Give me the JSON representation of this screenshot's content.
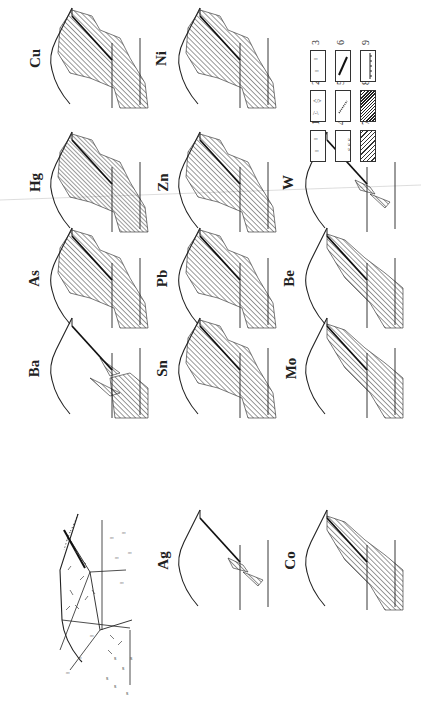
{
  "figure": {
    "orientation": "rotated-90-clockwise",
    "background": "#ffffff",
    "ink": "#222222"
  },
  "panels": [
    {
      "id": "cu",
      "label": "Cu",
      "col": 0,
      "row": 0,
      "halo": "strong"
    },
    {
      "id": "hg",
      "label": "Hg",
      "col": 0,
      "row": 1,
      "halo": "very-strong"
    },
    {
      "id": "as",
      "label": "As",
      "col": 0,
      "row": 2,
      "halo": "strong"
    },
    {
      "id": "ba",
      "label": "Ba",
      "col": 0,
      "row": 3,
      "halo": "deep"
    },
    {
      "id": "ni",
      "label": "Ni",
      "col": 1,
      "row": 0,
      "halo": "strong"
    },
    {
      "id": "zn",
      "label": "Zn",
      "col": 1,
      "row": 1,
      "halo": "strong"
    },
    {
      "id": "pb",
      "label": "Pb",
      "col": 1,
      "row": 2,
      "halo": "strong"
    },
    {
      "id": "sn",
      "label": "Sn",
      "col": 1,
      "row": 3,
      "halo": "strong"
    },
    {
      "id": "ag",
      "label": "Ag",
      "col": 1,
      "row": 4,
      "halo": "weak"
    },
    {
      "id": "w",
      "label": "W",
      "col": 2,
      "row": 1,
      "halo": "weak"
    },
    {
      "id": "be",
      "label": "Be",
      "col": 2,
      "row": 2,
      "halo": "medium"
    },
    {
      "id": "mo",
      "label": "Mo",
      "col": 2,
      "row": 3,
      "halo": "medium"
    },
    {
      "id": "co",
      "label": "Co",
      "col": 2,
      "row": 4,
      "halo": "medium"
    }
  ],
  "geologic_section": {
    "label": "",
    "col": 0,
    "row": 4
  },
  "legend": {
    "items": [
      {
        "num": "1",
        "pattern": "triangles-dots"
      },
      {
        "num": "2",
        "pattern": "dashes-brackets"
      },
      {
        "num": "3",
        "pattern": "dots-clusters"
      },
      {
        "num": "4",
        "pattern": "s-symbols"
      },
      {
        "num": "5",
        "pattern": "dotted-vein"
      },
      {
        "num": "6",
        "pattern": "thick-fault-line"
      },
      {
        "num": "7",
        "pattern": "sparse-hatch"
      },
      {
        "num": "8",
        "pattern": "dense-hatch"
      },
      {
        "num": "9",
        "pattern": "ticked-line"
      }
    ]
  }
}
